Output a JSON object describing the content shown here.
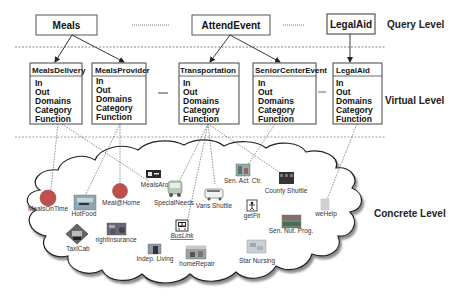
{
  "levels": {
    "query": "Query Level",
    "virtual": "Virtual Level",
    "concrete": "Concrete Level"
  },
  "query_nodes": [
    {
      "label": "Meals"
    },
    {
      "label": "AttendEvent"
    },
    {
      "label": "LegalAid"
    }
  ],
  "virtual_nodes": [
    {
      "title": "MealsDelivery",
      "attributes": [
        "In",
        "Out",
        "Domains",
        "Category",
        "Function"
      ]
    },
    {
      "title": "MealsProvider",
      "attributes": [
        "In",
        "Out",
        "Domains",
        "Category",
        "Function"
      ]
    },
    {
      "title": "Transportation",
      "attributes": [
        "In",
        "Out",
        "Domains",
        "Category",
        "Function"
      ]
    },
    {
      "title": "SeniorCenterEvent",
      "attributes": [
        "In",
        "Out",
        "Domains",
        "Category",
        "Function"
      ]
    },
    {
      "title": "LegalAid",
      "attributes": [
        "In",
        "Out",
        "Domains",
        "Category",
        "Function"
      ]
    }
  ],
  "concrete_services": [
    {
      "label": "MealsOnTime",
      "icon": "red-circle-icon"
    },
    {
      "label": "HotFood",
      "icon": "food-photo-icon"
    },
    {
      "label": "Meal@Home",
      "icon": "red-circle-icon"
    },
    {
      "label": "MealsAround",
      "icon": "meal-card-icon"
    },
    {
      "label": "SpecialNeeds",
      "icon": "wheelchair-bus-icon"
    },
    {
      "label": "Vans Shuttle",
      "icon": "van-icon"
    },
    {
      "label": "Sen. Act. Ctr.",
      "icon": "activity-center-icon"
    },
    {
      "label": "County Shuttle",
      "icon": "shuttle-bus-icon"
    },
    {
      "label": "getFit",
      "icon": "fitness-icon"
    },
    {
      "label": "weHelp",
      "icon": "help-icon"
    },
    {
      "label": "Sen. Nut. Prog.",
      "icon": "nutrition-photo-icon"
    },
    {
      "label": "TaxiCab",
      "icon": "taxi-sign-icon"
    },
    {
      "label": "rightInsurance",
      "icon": "insurance-car-icon"
    },
    {
      "label": "BusLink",
      "icon": "bus-icon"
    },
    {
      "label": "Indep. Living",
      "icon": "living-photo-icon"
    },
    {
      "label": "homeRepair",
      "icon": "house-photo-icon"
    },
    {
      "label": "Star Nursing",
      "icon": "nursing-photo-icon"
    }
  ],
  "colors": {
    "line": "#333333",
    "box_border": "#444444",
    "circle_fill": "#c0504d",
    "cloud_shadow": "#9a9a9a"
  }
}
